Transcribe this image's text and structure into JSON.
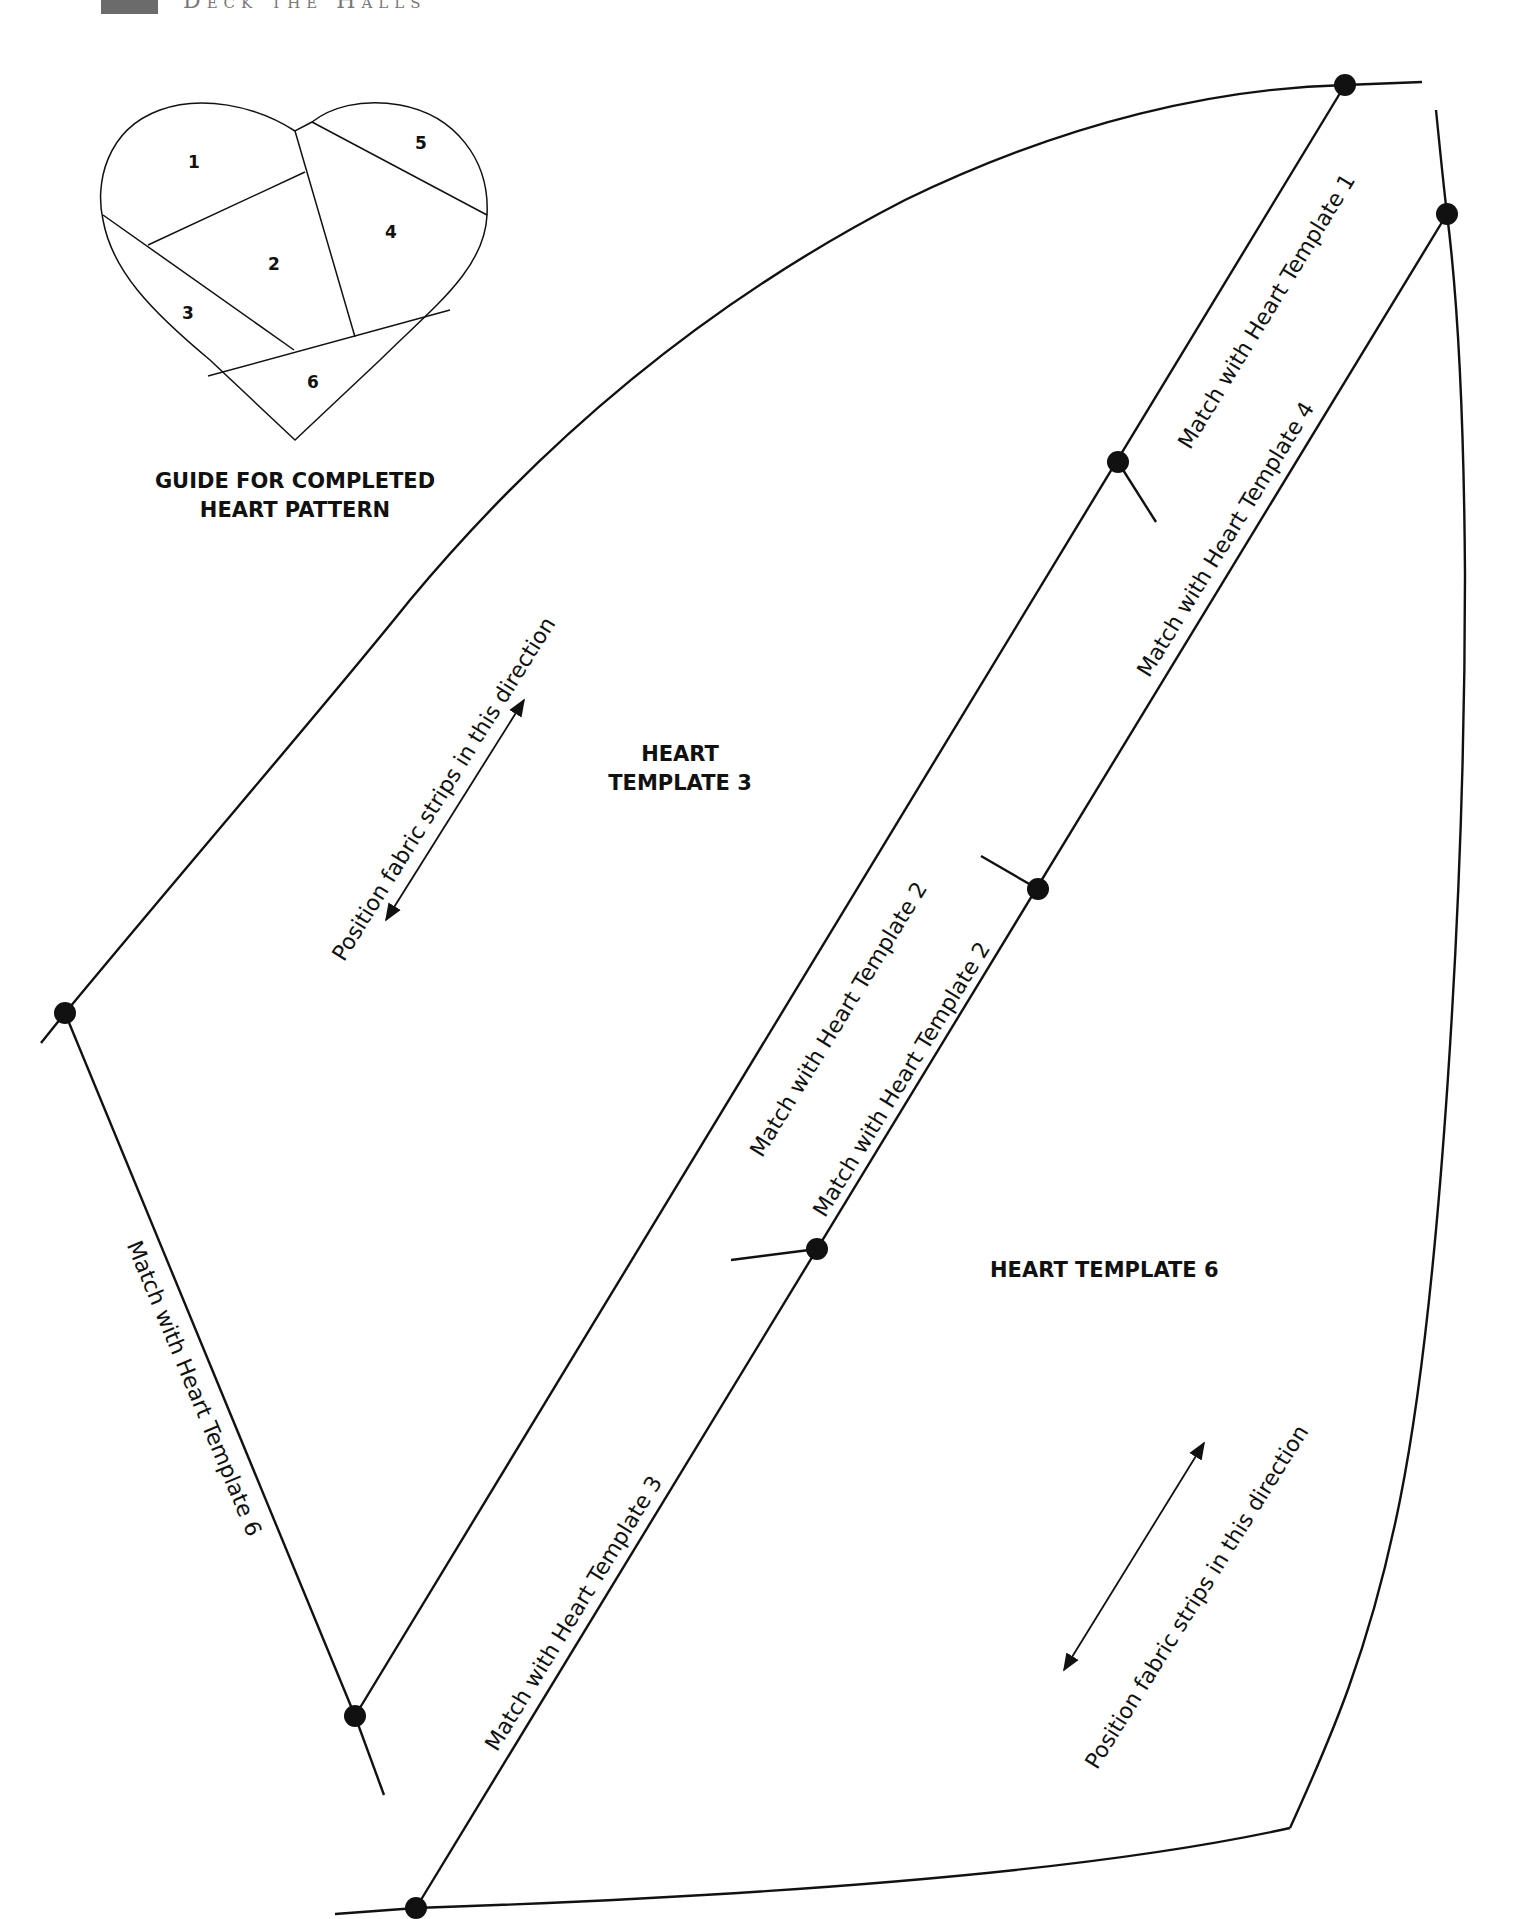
{
  "header": {
    "page_number_box": "",
    "running_title": "Deck the Halls"
  },
  "guide": {
    "title_line1": "GUIDE FOR COMPLETED",
    "title_line2": "HEART PATTERN",
    "pieces": [
      "1",
      "2",
      "3",
      "4",
      "5",
      "6"
    ]
  },
  "template3": {
    "title_line1": "HEART",
    "title_line2": "TEMPLATE 3",
    "grain_note": "Position fabric strips in this direction",
    "match_top_right": "Match with Heart Template 1",
    "match_right": "Match with Heart Template 2",
    "match_bottom_left": "Match with Heart Template 6"
  },
  "template6": {
    "title": "HEART TEMPLATE 6",
    "grain_note": "Position fabric strips in this direction",
    "match_upper_left": "Match with Heart Template 4",
    "match_left": "Match with Heart Template 2",
    "match_lower_left": "Match with Heart Template 3"
  },
  "colors": {
    "ink": "#111111",
    "paper": "#ffffff",
    "header_box": "#6b6b6b"
  }
}
